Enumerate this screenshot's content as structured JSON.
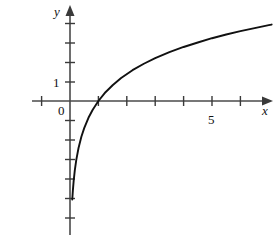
{
  "figure": {
    "name": "logarithmic-function-graph",
    "background_color": "#ffffff",
    "axis_color": "#4a4a4a",
    "curve_color": "#111111"
  },
  "labels": {
    "x_axis": "x",
    "y_axis": "y",
    "origin": "0",
    "y_tick_1": "1",
    "x_tick_5": "5"
  },
  "chart_data": {
    "type": "line",
    "title": "",
    "xlabel": "x",
    "ylabel": "y",
    "grid": false,
    "legend": false,
    "xlim": [
      -1.1,
      7.1
    ],
    "ylim": [
      -5.2,
      4.4
    ],
    "x_ticks": [
      -1,
      1,
      2,
      3,
      4,
      5,
      6
    ],
    "x_tick_labels": [
      "",
      "",
      "",
      "",
      "",
      "5",
      ""
    ],
    "y_ticks": [
      -5,
      -4,
      -3,
      -2,
      -1,
      1,
      2,
      3,
      4
    ],
    "y_tick_labels": [
      "",
      "",
      "",
      "",
      "",
      "1",
      "",
      "",
      ""
    ],
    "origin_label": "0",
    "series": [
      {
        "name": "y = 2 ln x",
        "description": "logarithmic curve passing through (1, 0), increasing and concave down, with vertical asymptote at x = 0",
        "x": [
          0.08,
          0.1,
          0.13,
          0.17,
          0.22,
          0.3,
          0.4,
          0.5,
          0.65,
          0.8,
          1.0,
          1.25,
          1.5,
          1.8,
          2.2,
          2.6,
          3.0,
          3.5,
          4.0,
          4.5,
          5.0,
          5.5,
          6.0,
          6.5,
          7.0,
          7.1
        ],
        "y": [
          -5.05,
          -4.61,
          -4.08,
          -3.55,
          -3.03,
          -2.41,
          -1.83,
          -1.39,
          -0.86,
          -0.45,
          0.0,
          0.45,
          0.81,
          1.18,
          1.58,
          1.91,
          2.2,
          2.51,
          2.77,
          3.0,
          3.22,
          3.41,
          3.58,
          3.74,
          3.89,
          3.92
        ]
      }
    ]
  }
}
